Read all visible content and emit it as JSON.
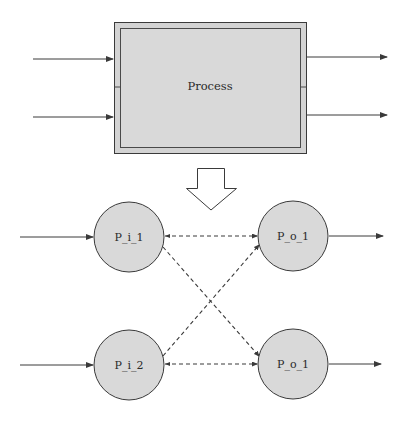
{
  "colors": {
    "background": "#ffffff",
    "stroke": "#3a3a3a",
    "fill": "#d9d9d9",
    "border_strip": "#cfcfcf"
  },
  "process_box": {
    "label": "Process",
    "inputs": 2,
    "outputs": 2
  },
  "transform_arrow": {
    "icon": "hollow-down-arrow-icon"
  },
  "nodes": [
    {
      "id": "n1",
      "label": "P_i_1",
      "role": "input"
    },
    {
      "id": "n2",
      "label": "P_i_2",
      "role": "input"
    },
    {
      "id": "n3",
      "label": "P_o_1",
      "role": "output"
    },
    {
      "id": "n4",
      "label": "P_o_1",
      "role": "output"
    }
  ],
  "edges": [
    {
      "from": "P_i_1",
      "to": "P_o_1 (top)",
      "style": "dashed"
    },
    {
      "from": "P_i_1",
      "to": "P_o_1 (bottom)",
      "style": "dashed"
    },
    {
      "from": "P_i_2",
      "to": "P_o_1 (top)",
      "style": "dashed"
    },
    {
      "from": "P_i_2",
      "to": "P_o_1 (bottom)",
      "style": "dashed"
    }
  ]
}
